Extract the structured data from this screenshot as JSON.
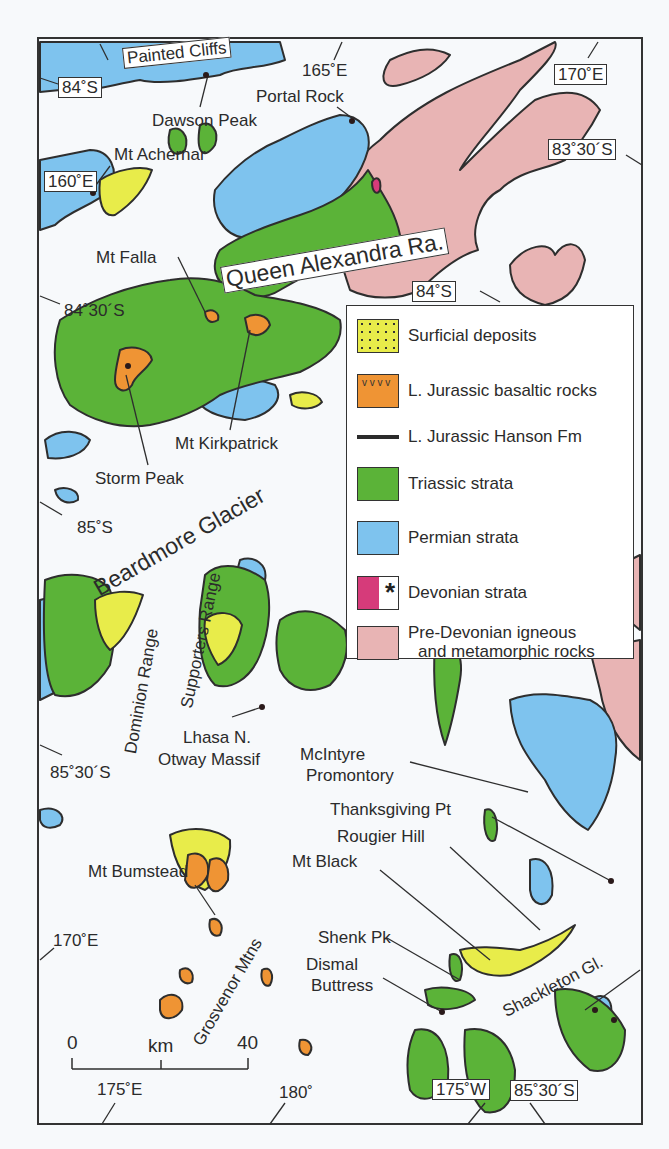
{
  "map": {
    "title": "Geologic map of the central Transantarctic Mountains",
    "frame": {
      "left": 38,
      "top": 38,
      "right": 642,
      "bottom": 1124
    }
  },
  "coordinate_labels": {
    "lat_84s_top": "84˚S",
    "lat_83_30s": "83˚30´S",
    "lat_84s_mid": "84˚S",
    "lat_84_30s": "84˚30´S",
    "lat_85s": "85˚S",
    "lat_85_30s_left": "85˚30´S",
    "lat_85_30s_bottom": "85˚30´S",
    "lon_160e": "160˚E",
    "lon_165e": "165˚E",
    "lon_170e_top": "170˚E",
    "lon_170e_left": "170˚E",
    "lon_175e": "175˚E",
    "lon_180": "180˚",
    "lon_175w": "175˚W"
  },
  "place_labels": {
    "painted_cliffs": "Painted Cliffs",
    "dawson_peak": "Dawson Peak",
    "portal_rock": "Portal Rock",
    "mt_achernar": "Mt Achernar",
    "mt_falla": "Mt Falla",
    "queen_alexandra": "Queen Alexandra Ra.",
    "mt_kirkpatrick": "Mt Kirkpatrick",
    "storm_peak": "Storm Peak",
    "beardmore": "Beardmore Glacier",
    "supporters": "Supporters Range",
    "dominion": "Dominion Range",
    "lhasa": "Lhasa N.",
    "otway": "Otway Massif",
    "mcintyre_1": "McIntyre",
    "mcintyre_2": "Promontory",
    "thanksgiving": "Thanksgiving Pt",
    "rougier": "Rougier Hill",
    "mt_black": "Mt Black",
    "mt_bumstead": "Mt Bumstead",
    "shenk": "Shenk Pk",
    "dismal_1": "Dismal",
    "dismal_2": "Buttress",
    "grosvenor": "Grosvenor Mtns",
    "shackleton": "Shackleton Gl."
  },
  "scale_bar": {
    "zero": "0",
    "unit": "km",
    "max": "40"
  },
  "legend": {
    "items": [
      {
        "label": "Surficial deposits",
        "color": "#e8ec4a"
      },
      {
        "label": "L. Jurassic basaltic rocks",
        "color": "#ef9434"
      },
      {
        "label": "L. Jurassic Hanson Fm",
        "color": "#2b2b2b"
      },
      {
        "label": "Triassic strata",
        "color": "#5bb338"
      },
      {
        "label": "Permian strata",
        "color": "#7ec3ee"
      },
      {
        "label": "Devonian strata",
        "color": "#d63b7a"
      },
      {
        "label": "Pre-Devonian igneous",
        "label2": "and metamorphic rocks",
        "color": "#e8b4b4"
      }
    ],
    "devonian_symbol": "*",
    "basalt_symbol": "v v v v"
  }
}
